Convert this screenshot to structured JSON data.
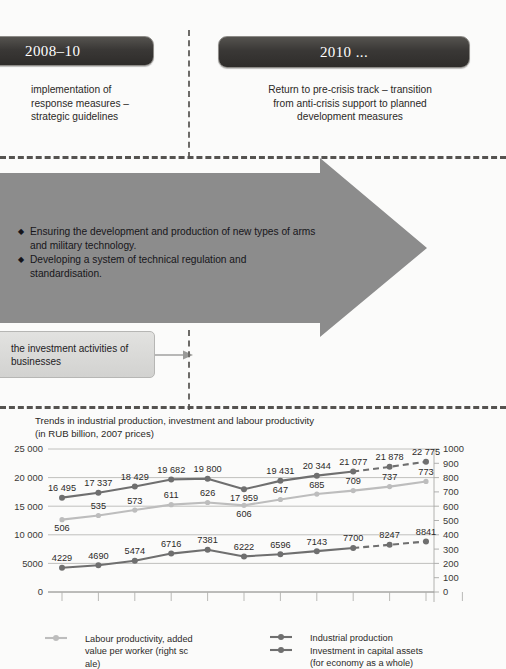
{
  "phases": [
    {
      "title": "2008–10",
      "description": "implementation of\nresponse measures –\nstrategic guidelines"
    },
    {
      "title": "2010 ...",
      "description": "Return to pre-crisis track – transition\nfrom anti-crisis support to planned\ndevelopment measures"
    }
  ],
  "arrow": {
    "bullet_glyph": "◆",
    "bullets": [
      "Ensuring the development and production of new types of arms and military technology.",
      "Developing a system of technical regulation and standardisation."
    ],
    "fill_color": "#8c8c8c"
  },
  "investment_box": {
    "label": "the investment activities of businesses",
    "arrow_icon": "right-arrow-icon"
  },
  "chart_data": {
    "type": "line",
    "title": "Trends in industrial production, investment and labour productivity (in RUB billion, 2007 prices)",
    "title_line1": "Trends in industrial production, investment and labour productivity",
    "title_line2": "(in RUB billion, 2007 prices)",
    "xlabel": "",
    "ylabel": "",
    "y_left_label": "",
    "y_right_label": "",
    "ylim": [
      0,
      25000
    ],
    "y_right_lim": [
      0,
      1000
    ],
    "y_left_ticks": [
      "0",
      "5000",
      "10 000",
      "15 000",
      "20 000",
      "25 000"
    ],
    "y_left_tick_values": [
      0,
      5000,
      10000,
      15000,
      20000,
      25000
    ],
    "y_right_ticks": [
      "0",
      "100",
      "200",
      "300",
      "400",
      "500",
      "600",
      "700",
      "800",
      "900",
      "1000"
    ],
    "y_right_tick_values": [
      0,
      100,
      200,
      300,
      400,
      500,
      600,
      700,
      800,
      900,
      1000
    ],
    "x_tick_count": 12,
    "x_tick_labels": [
      "",
      "",
      "",
      "",
      "",
      "",
      "",
      "",
      "",
      "",
      "",
      ""
    ],
    "grid": "horizontal",
    "legend_position": "bottom",
    "forecast_starts_at_index": 8,
    "series": [
      {
        "name": "Industrial production",
        "axis": "left",
        "color": "#6f6f6f",
        "values": [
          16495,
          17337,
          18429,
          19682,
          19800,
          17959,
          19431,
          20344,
          21077,
          21878,
          22775
        ],
        "labels": [
          "16 495",
          "17 337",
          "18 429",
          "19 682",
          "19 800",
          "17 959",
          "19 431",
          "20 344",
          "21 077",
          "21 878",
          "22 775"
        ]
      },
      {
        "name": "Investment in capital assets (for economy as a whole)",
        "axis": "left",
        "color": "#6f6f6f",
        "values": [
          4229,
          4690,
          5474,
          6716,
          7381,
          6222,
          6596,
          7143,
          7700,
          8247,
          8841
        ],
        "labels": [
          "4229",
          "4690",
          "5474",
          "6716",
          "7381",
          "6222",
          "6596",
          "7143",
          "7700",
          "8247",
          "8841"
        ]
      },
      {
        "name": "Labour productivity, added value per  worker (right sc ale)",
        "axis": "right",
        "color": "#bdbdbd",
        "values": [
          506,
          535,
          573,
          611,
          626,
          606,
          647,
          685,
          709,
          737,
          773
        ],
        "labels": [
          "506",
          "535",
          "573",
          "611",
          "626",
          "606",
          "647",
          "685",
          "709",
          "737",
          "773"
        ]
      }
    ]
  },
  "legend": [
    {
      "name": "labour-productivity",
      "marker_color": "#bdbdbd",
      "text_line1": "Labour productivity, added",
      "text_line2": "value per  worker (right sc",
      "text_line3": "ale)"
    },
    {
      "name": "industrial-production",
      "marker_color": "#6f6f6f",
      "text_line1": "Industrial production",
      "text_line2": "",
      "text_line3": ""
    },
    {
      "name": "investment-capital-assets",
      "marker_color": "#6f6f6f",
      "text_line1": "Investment in capital assets",
      "text_line2": "(for economy as a whole)",
      "text_line3": ""
    }
  ]
}
